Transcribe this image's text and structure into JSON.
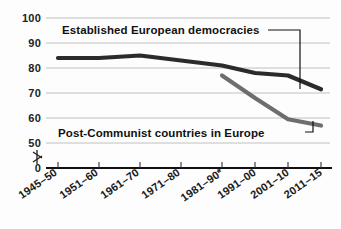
{
  "chart_data": {
    "type": "line",
    "title": "",
    "subtitle": "",
    "xlabel": "",
    "ylabel": "",
    "ylim": [
      0,
      100
    ],
    "yticks": [
      "0",
      "50",
      "60",
      "70",
      "80",
      "90",
      "100"
    ],
    "grid": true,
    "axis_break": true,
    "axis_break_note": "y-axis broken between 0 and 50",
    "legend_position": "inline-labels-with-leader-lines",
    "categories": [
      "1945–50",
      "1951–60",
      "1961–70",
      "1971–80",
      "1981–90*",
      "1991–00",
      "2001–10",
      "2011–15"
    ],
    "series": [
      {
        "name": "Established European democracies",
        "color": "#2b2b2b",
        "values": [
          84,
          84,
          85,
          83,
          81,
          78,
          77,
          71.5
        ]
      },
      {
        "name": "Post-Communist countries in Europe",
        "color": "#6e6e6e",
        "values": [
          null,
          null,
          null,
          null,
          77,
          68,
          59.5,
          57
        ]
      }
    ],
    "annotations": [
      {
        "id": "label-established",
        "text": "Established European democracies",
        "points_to_series": "Established European democracies",
        "points_to_category": "2011–15"
      },
      {
        "id": "label-postcommunist",
        "text": "Post-Communist countries in Europe",
        "points_to_series": "Post-Communist countries in Europe",
        "points_to_category": "2011–15"
      }
    ]
  },
  "colors": {
    "established_line": "#2b2b2b",
    "postcommunist_line": "#6e6e6e",
    "gridline": "#b9b9b9",
    "axis": "#111111",
    "background": "#fdfdfd",
    "text": "#1a1a1a"
  },
  "yticks": {
    "t0": "0",
    "t50": "50",
    "t60": "60",
    "t70": "70",
    "t80": "80",
    "t90": "90",
    "t100": "100"
  },
  "xticks": {
    "c0": "1945–50",
    "c1": "1951–60",
    "c2": "1961–70",
    "c3": "1971–80",
    "c4": "1981–90*",
    "c5": "1991–00",
    "c6": "2001–10",
    "c7": "2011–15"
  },
  "labels": {
    "established": "Established European democracies",
    "postcommunist": "Post-Communist countries in Europe"
  }
}
